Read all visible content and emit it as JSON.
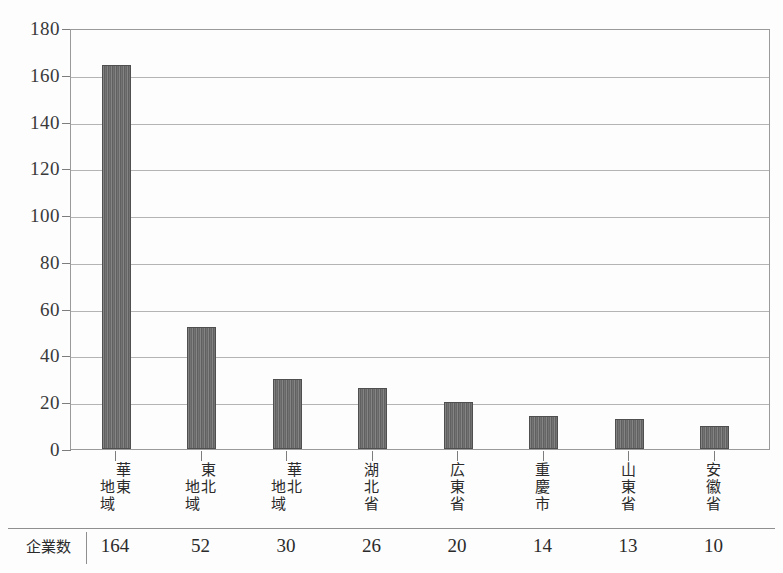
{
  "chart_data": {
    "type": "bar",
    "title": "",
    "subtitle": "",
    "xlabel": "",
    "ylabel": "",
    "ylim": [
      0,
      180
    ],
    "ytick_step": 20,
    "yticks": [
      0,
      20,
      40,
      60,
      80,
      100,
      120,
      140,
      160,
      180
    ],
    "grid": true,
    "legend": false,
    "categories": [
      "華東地域",
      "東北地域",
      "華北地域",
      "湖北省",
      "広東省",
      "重慶市",
      "山東省",
      "安徽省"
    ],
    "values": [
      164,
      52,
      30,
      26,
      20,
      14,
      13,
      10
    ],
    "series": [
      {
        "name": "企業数",
        "values": [
          164,
          52,
          30,
          26,
          20,
          14,
          13,
          10
        ]
      }
    ],
    "bar_color": "#6b6b6b",
    "bar_edge_color": "#4f4f4f",
    "grid_color": "#b4b4b4",
    "axis_color": "#9a9a9a"
  },
  "table": {
    "row_header": "企業数",
    "values": [
      "164",
      "52",
      "30",
      "26",
      "20",
      "14",
      "13",
      "10"
    ]
  },
  "axis": {
    "y_tick_labels": [
      "180",
      "160",
      "140",
      "120",
      "100",
      "80",
      "60",
      "40",
      "20",
      "0"
    ]
  },
  "x_labels": [
    {
      "col_first": [
        "華",
        "東"
      ],
      "col_second": [
        "地",
        "域"
      ]
    },
    {
      "col_first": [
        "東",
        "北"
      ],
      "col_second": [
        "地",
        "域"
      ]
    },
    {
      "col_first": [
        "華",
        "北"
      ],
      "col_second": [
        "地",
        "域"
      ]
    },
    {
      "col_first": [
        "湖",
        "北",
        "省"
      ],
      "col_second": []
    },
    {
      "col_first": [
        "広",
        "東",
        "省"
      ],
      "col_second": []
    },
    {
      "col_first": [
        "重",
        "慶",
        "市"
      ],
      "col_second": []
    },
    {
      "col_first": [
        "山",
        "東",
        "省"
      ],
      "col_second": []
    },
    {
      "col_first": [
        "安",
        "徽",
        "省"
      ],
      "col_second": []
    }
  ]
}
